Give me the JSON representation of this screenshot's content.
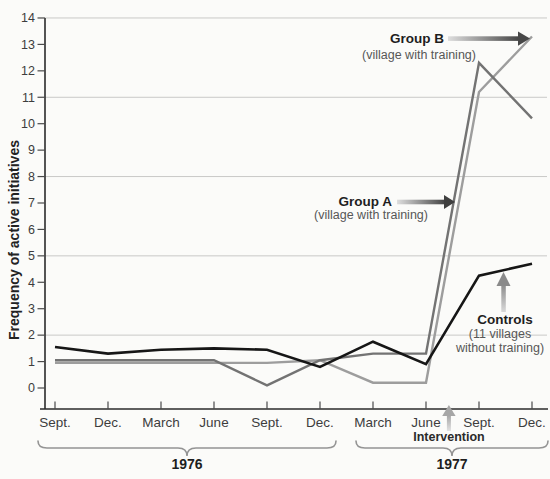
{
  "figure": {
    "background": "#fbfbf9",
    "annotations": {
      "group_b": {
        "title": "Group B",
        "subtitle": "(village with training)"
      },
      "group_a": {
        "title": "Group A",
        "subtitle": "(village with training)"
      },
      "controls": {
        "title": "Controls",
        "subtitle_line1": "(11 villages",
        "subtitle_line2": "without training)"
      },
      "intervention": {
        "label": "Intervention"
      }
    }
  },
  "chart_data": {
    "type": "line",
    "title": "",
    "xlabel": "",
    "ylabel": "Frequency of active initiatives",
    "ylim": [
      0,
      14
    ],
    "y_ticks": [
      0,
      1,
      2,
      3,
      4,
      5,
      6,
      7,
      8,
      9,
      10,
      11,
      12,
      13,
      14
    ],
    "gridlines_at": [
      2,
      5,
      8,
      11,
      14
    ],
    "grid": "horizontal-only",
    "x_tick_labels": [
      "Sept.",
      "Dec.",
      "March",
      "June",
      "Sept.",
      "Dec.",
      "March",
      "June",
      "Sept.",
      "Dec."
    ],
    "year_groups": [
      {
        "label": "1976",
        "start": 0,
        "end": 5
      },
      {
        "label": "1977",
        "start": 6,
        "end": 9
      }
    ],
    "intervention_between_ticks": [
      7,
      8
    ],
    "legend_position": "inline-annotations",
    "series": [
      {
        "name": "Group B",
        "description": "village with training",
        "color": "#9d9d9d",
        "values": [
          0.95,
          0.95,
          0.95,
          0.95,
          0.95,
          1.05,
          0.2,
          0.2,
          11.2,
          13.3
        ]
      },
      {
        "name": "Group A",
        "description": "village with training",
        "color": "#737373",
        "values": [
          1.05,
          1.05,
          1.05,
          1.05,
          0.1,
          1.05,
          1.3,
          1.3,
          12.3,
          10.2
        ]
      },
      {
        "name": "Controls",
        "description": "11 villages without training",
        "color": "#161616",
        "values": [
          1.55,
          1.3,
          1.45,
          1.5,
          1.45,
          0.8,
          1.75,
          0.9,
          4.25,
          4.7
        ]
      }
    ],
    "axis_colors": {
      "axis": "#2b2b2b",
      "ticks": "#4a4a4a",
      "labels": "#3d3d3d",
      "gridline": "#c9c9c7",
      "brace": "#949494"
    }
  }
}
